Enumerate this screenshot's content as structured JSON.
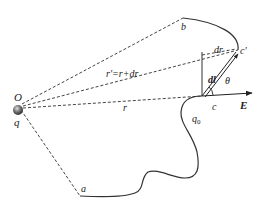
{
  "diagram": {
    "labels": {
      "origin": "O",
      "source_charge": "q",
      "point_a": "a",
      "point_b": "b",
      "point_c": "c",
      "point_c_prime": "c′",
      "test_charge": "q",
      "test_charge_sub": "0",
      "r": "r",
      "r_prime": "r′=r+dr",
      "dr": "dr",
      "dl": "dl",
      "theta": "θ",
      "field": "E"
    },
    "colors": {
      "line": "#333333",
      "dashed": "#444444",
      "charge": "#555555",
      "background": "#ffffff"
    },
    "points": {
      "O": [
        20,
        107
      ],
      "a": [
        80,
        196
      ],
      "b": [
        183,
        18
      ],
      "c": [
        202,
        96
      ],
      "c_prime": [
        238,
        52
      ]
    }
  }
}
